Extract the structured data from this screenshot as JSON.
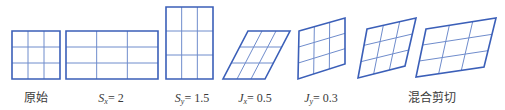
{
  "colors": {
    "stroke": "#3b5fb8",
    "grid": "#6f8ccc",
    "text": "#3a3a3a"
  },
  "grid": {
    "rows": 3,
    "cols": 3
  },
  "shapes": [
    {
      "id": "original",
      "corners": [
        [
          12,
          31
        ],
        [
          60,
          31
        ],
        [
          60,
          79
        ],
        [
          12,
          79
        ]
      ]
    },
    {
      "id": "scale-x",
      "corners": [
        [
          66,
          31
        ],
        [
          158,
          31
        ],
        [
          158,
          79
        ],
        [
          66,
          79
        ]
      ]
    },
    {
      "id": "scale-y",
      "corners": [
        [
          166,
          7
        ],
        [
          213,
          7
        ],
        [
          213,
          79
        ],
        [
          166,
          79
        ]
      ]
    },
    {
      "id": "shear-x",
      "corners": [
        [
          248,
          31
        ],
        [
          290,
          31
        ],
        [
          265,
          79
        ],
        [
          223,
          79
        ]
      ]
    },
    {
      "id": "shear-y",
      "corners": [
        [
          299,
          31
        ],
        [
          345,
          18
        ],
        [
          345,
          64
        ],
        [
          298,
          79
        ]
      ]
    },
    {
      "id": "mixed-1",
      "corners": [
        [
          367,
          29
        ],
        [
          416,
          18
        ],
        [
          405,
          66
        ],
        [
          358,
          78
        ]
      ]
    },
    {
      "id": "mixed-2",
      "corners": [
        [
          426,
          29
        ],
        [
          496,
          18
        ],
        [
          484,
          67
        ],
        [
          416,
          77
        ]
      ]
    }
  ],
  "labels": [
    {
      "id": "original",
      "x": 36,
      "text": "原始"
    },
    {
      "id": "scale-x",
      "x": 111,
      "var": "S",
      "sub": "x",
      "value": "= 2"
    },
    {
      "id": "scale-y",
      "x": 192,
      "var": "S",
      "sub": "y",
      "value": "= 1.5"
    },
    {
      "id": "shear-x",
      "x": 255,
      "var": "J",
      "sub": "x",
      "value": "= 0.5"
    },
    {
      "id": "shear-y",
      "x": 321,
      "var": "J",
      "sub": "y",
      "value": "= 0.3"
    },
    {
      "id": "mixed",
      "x": 432,
      "text": "混合剪切"
    }
  ]
}
